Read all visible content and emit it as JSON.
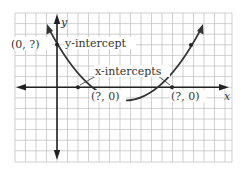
{
  "diagram": {
    "type": "parabola-graph",
    "axes": {
      "x_label": "x",
      "y_label": "y"
    },
    "labels": {
      "y_intercept_point": "(0, ?)",
      "y_intercept_text": "y-intercept",
      "x_intercepts_text": "x-intercepts",
      "x_intercept_left_point": "(?, 0)",
      "x_intercept_right_point": "(?, 0)"
    },
    "colors": {
      "grid": "#bbbbbb",
      "axis": "#222222",
      "curve": "#333333",
      "text": "#333333"
    }
  }
}
